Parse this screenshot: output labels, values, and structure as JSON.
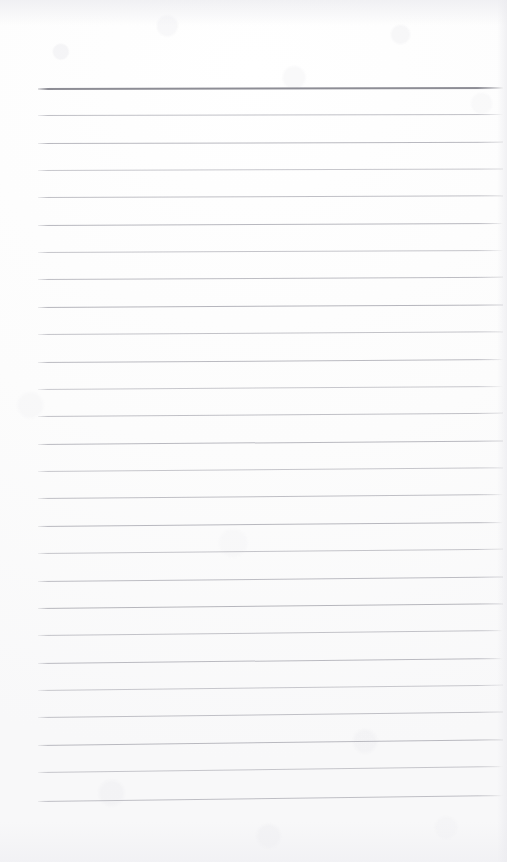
{
  "document": {
    "kind": "scanned-lined-paper",
    "title": "Blank ruled notepad page",
    "caption": "",
    "page_width": 507,
    "page_height": 862,
    "paper_color": "#fdfdfd",
    "has_text_content": false,
    "written_content": []
  },
  "ruling": {
    "line_count": 27,
    "line_color": "#b4b4bb",
    "header_line_color": "#8d8d95",
    "header_line_index": 0,
    "header_line_thickness_px": 2,
    "line_thickness_px": 1,
    "left_margin_px": 38,
    "right_end_px": 503,
    "first_line_y_px": 88,
    "line_spacing_px": 27.4,
    "skew_degrees": -0.75,
    "lines": [
      {
        "index": 0,
        "y": 88,
        "weight": "heavy"
      },
      {
        "index": 1,
        "y": 115,
        "weight": "light"
      },
      {
        "index": 2,
        "y": 143,
        "weight": "light"
      },
      {
        "index": 3,
        "y": 170,
        "weight": "light"
      },
      {
        "index": 4,
        "y": 197,
        "weight": "light"
      },
      {
        "index": 5,
        "y": 225,
        "weight": "light"
      },
      {
        "index": 6,
        "y": 252,
        "weight": "light"
      },
      {
        "index": 7,
        "y": 279,
        "weight": "light"
      },
      {
        "index": 8,
        "y": 307,
        "weight": "light"
      },
      {
        "index": 9,
        "y": 334,
        "weight": "light"
      },
      {
        "index": 10,
        "y": 362,
        "weight": "light"
      },
      {
        "index": 11,
        "y": 389,
        "weight": "light"
      },
      {
        "index": 12,
        "y": 416,
        "weight": "light"
      },
      {
        "index": 13,
        "y": 444,
        "weight": "light"
      },
      {
        "index": 14,
        "y": 471,
        "weight": "light"
      },
      {
        "index": 15,
        "y": 498,
        "weight": "light"
      },
      {
        "index": 16,
        "y": 526,
        "weight": "light"
      },
      {
        "index": 17,
        "y": 553,
        "weight": "light"
      },
      {
        "index": 18,
        "y": 581,
        "weight": "light"
      },
      {
        "index": 19,
        "y": 608,
        "weight": "light"
      },
      {
        "index": 20,
        "y": 635,
        "weight": "light"
      },
      {
        "index": 21,
        "y": 663,
        "weight": "light"
      },
      {
        "index": 22,
        "y": 690,
        "weight": "light"
      },
      {
        "index": 23,
        "y": 717,
        "weight": "light"
      },
      {
        "index": 24,
        "y": 745,
        "weight": "light"
      },
      {
        "index": 25,
        "y": 772,
        "weight": "light"
      },
      {
        "index": 26,
        "y": 801,
        "weight": "light"
      }
    ]
  },
  "margins": {
    "top_blank_px": 88,
    "bottom_blank_px": 61,
    "left_blank_px": 38,
    "right_blank_px": 4
  }
}
